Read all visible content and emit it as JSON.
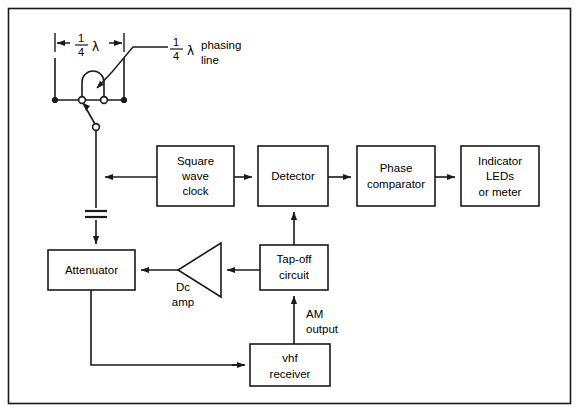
{
  "figure": {
    "background": "#ffffff",
    "line_color": "#1a1a1a",
    "frame": {
      "x": 8,
      "y": 8,
      "width": 562,
      "height": 396
    }
  },
  "antenna": {
    "dimension_label": {
      "numerator": "1",
      "denominator": "4",
      "symbol": "λ"
    },
    "phasing_label": {
      "numerator": "1",
      "denominator": "4",
      "symbol": "λ",
      "line1": "phasing",
      "line2": "line"
    }
  },
  "blocks": [
    {
      "id": "square-wave-clock",
      "name": "square-wave-clock-block",
      "lines": [
        "Square",
        "wave",
        "clock"
      ],
      "x": 157,
      "y": 146,
      "w": 77,
      "h": 60
    },
    {
      "id": "detector",
      "name": "detector-block",
      "lines": [
        "Detector"
      ],
      "x": 258,
      "y": 146,
      "w": 70,
      "h": 60
    },
    {
      "id": "phase-comparator",
      "name": "phase-comparator-block",
      "lines": [
        "Phase",
        "comparator"
      ],
      "x": 357,
      "y": 146,
      "w": 78,
      "h": 60
    },
    {
      "id": "indicator-leds",
      "name": "indicator-leds-block",
      "lines": [
        "Indicator",
        "LEDs",
        "or  meter"
      ],
      "x": 461,
      "y": 146,
      "w": 78,
      "h": 60
    },
    {
      "id": "attenuator",
      "name": "attenuator-block",
      "lines": [
        "Attenuator"
      ],
      "x": 48,
      "y": 250,
      "w": 87,
      "h": 40
    },
    {
      "id": "tap-off-circuit",
      "name": "tap-off-circuit-block",
      "lines": [
        "Tap-off",
        "circuit"
      ],
      "x": 260,
      "y": 245,
      "w": 68,
      "h": 45
    },
    {
      "id": "vhf-receiver",
      "name": "vhf-receiver-block",
      "lines": [
        "vhf",
        "receiver"
      ],
      "x": 250,
      "y": 344,
      "w": 80,
      "h": 42
    }
  ],
  "amplifier": {
    "name": "dc-amp-symbol",
    "label_line1": "Dc",
    "label_line2": "amp",
    "apex_x": 178,
    "apex_y": 270,
    "back_x": 221,
    "top_y": 243,
    "bottom_y": 297
  },
  "annotations": [
    {
      "id": "am-output",
      "name": "am-output-label",
      "line1": "AM",
      "line2": "output",
      "x": 308,
      "y": 313
    }
  ],
  "capacitor": {
    "name": "capacitor-symbol",
    "x": 96,
    "y": 212
  }
}
